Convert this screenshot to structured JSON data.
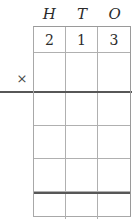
{
  "worksheet": {
    "title": "Place value multiplication grid",
    "columns": [
      {
        "key": "hundreds",
        "label": "H"
      },
      {
        "key": "tens",
        "label": "T"
      },
      {
        "key": "ones",
        "label": "O"
      }
    ],
    "operand_digits": [
      "2",
      "1",
      "3"
    ],
    "operand_value": "213",
    "operator": {
      "symbol": "×",
      "name": "multiplication-sign"
    },
    "rows": [
      {
        "name": "operand-row",
        "cells": [
          "2",
          "1",
          "3"
        ]
      },
      {
        "name": "multiplier-row",
        "cells": [
          "",
          "",
          ""
        ]
      },
      {
        "name": "partial-product-row-1",
        "cells": [
          "",
          "",
          ""
        ]
      },
      {
        "name": "partial-product-row-2",
        "cells": [
          "",
          "",
          ""
        ]
      },
      {
        "name": "partial-product-row-3",
        "cells": [
          "",
          "",
          ""
        ]
      },
      {
        "name": "total-row",
        "cells": [
          "",
          "",
          ""
        ]
      }
    ],
    "colors": {
      "ink": "#2b2b2b",
      "grid_line": "#b0b0b0",
      "rule_line": "#575757",
      "paper": "#ffffff"
    }
  }
}
